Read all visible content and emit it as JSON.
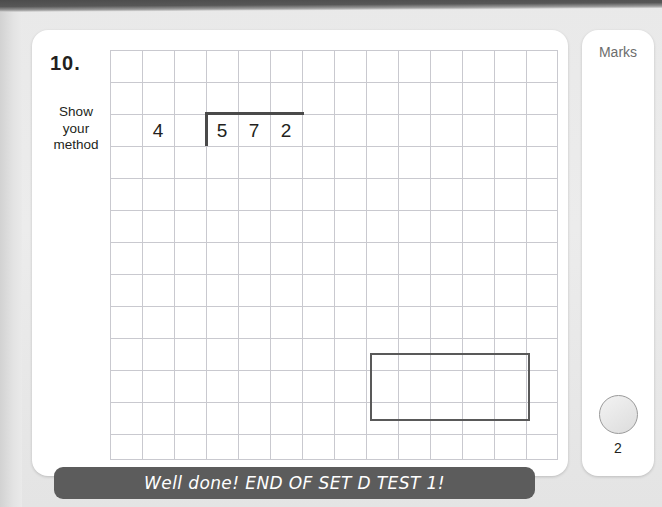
{
  "worksheet": {
    "question_number": "10.",
    "show_method_label": "Show\nyour\nmethod",
    "division": {
      "divisor": "4",
      "dividend_digits": [
        "5",
        "7",
        "2"
      ],
      "operation": "long-division",
      "expression": "572 ÷ 4"
    },
    "answer_box": {
      "value": "",
      "placeholder": ""
    },
    "grid": {
      "cell_size_px": 32,
      "columns": 14,
      "rows": 13,
      "line_color": "#c9c9cf"
    }
  },
  "marks_panel": {
    "title": "Marks",
    "mark_value": "2"
  },
  "footer": {
    "message": "Well done! END OF SET D TEST 1!"
  },
  "colors": {
    "page_background": "#e6e6e6",
    "card_background": "#ffffff",
    "ink": "#231f20",
    "grid_line": "#c9c9cf",
    "banner_background": "#5c5c5c",
    "banner_text": "#ffffff",
    "mark_circle_border": "#9a9a9a"
  }
}
